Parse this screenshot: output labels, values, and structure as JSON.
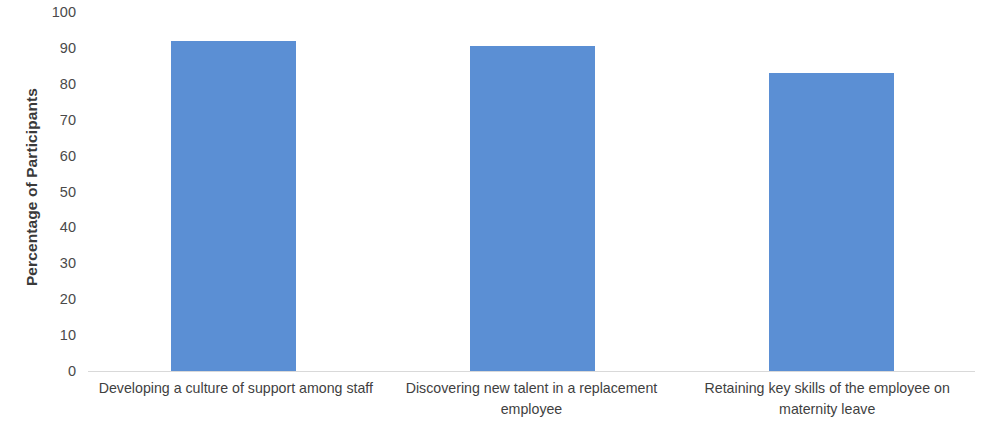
{
  "chart_data": {
    "type": "bar",
    "title": "",
    "subtitle": "",
    "xlabel": "",
    "ylabel": "Percentage of Participants",
    "ylim": [
      0,
      100
    ],
    "ytick_labels": [
      "100",
      "90",
      "80",
      "70",
      "60",
      "50",
      "40",
      "30",
      "20",
      "10",
      "0"
    ],
    "ytick_values": [
      100,
      90,
      80,
      70,
      60,
      50,
      40,
      30,
      20,
      10,
      0
    ],
    "grid": false,
    "legend": "none",
    "bar_color": "#5B8FD4",
    "categories": [
      "Developing a culture of support among staff",
      "Discovering new talent in a replacement employee",
      "Retaining key skills of the employee on maternity leave"
    ],
    "values": [
      92,
      90.5,
      83
    ]
  }
}
